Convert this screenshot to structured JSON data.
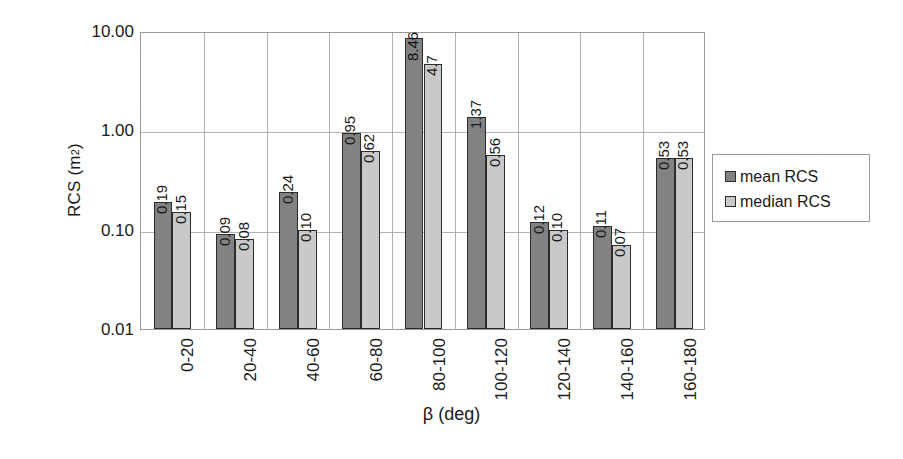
{
  "chart_data": {
    "type": "bar",
    "title": "",
    "xlabel": "β (deg)",
    "ylabel": "RCS (m²)",
    "yscale": "log",
    "ylim": [
      0.01,
      10.0
    ],
    "ytick_labels": [
      "10.00",
      "1.00",
      "0.10",
      "0.01"
    ],
    "ytick_values": [
      10.0,
      1.0,
      0.1,
      0.01
    ],
    "grid": "horizontal-and-vertical",
    "legend_position": "right",
    "categories": [
      "0-20",
      "20-40",
      "40-60",
      "60-80",
      "80-100",
      "100-120",
      "120-140",
      "140-160",
      "160-180"
    ],
    "series": [
      {
        "name": "mean RCS",
        "color": "#828282",
        "values": [
          0.19,
          0.09,
          0.24,
          0.95,
          8.46,
          1.37,
          0.12,
          0.11,
          0.53
        ],
        "labels": [
          "0.19",
          "0.09",
          "0.24",
          "0.95",
          "8.46",
          "1.37",
          "0.12",
          "0.11",
          "0.53"
        ]
      },
      {
        "name": "median RCS",
        "color": "#c9c9c9",
        "values": [
          0.15,
          0.08,
          0.1,
          0.62,
          4.7,
          0.56,
          0.1,
          0.07,
          0.53
        ],
        "labels": [
          "0.15",
          "0.08",
          "0.10",
          "0.62",
          "4.7",
          "0.56",
          "0.10",
          "0.07",
          "0.53"
        ]
      }
    ]
  },
  "axis": {
    "y_title_main": "RCS (m",
    "y_title_sup": "2",
    "y_title_close": ")",
    "x_title": "β (deg)"
  },
  "legend": {
    "items": [
      {
        "label": "mean RCS",
        "swatch": "mean"
      },
      {
        "label": "median RCS",
        "swatch": "median"
      }
    ]
  },
  "colors": {
    "mean": "#828282",
    "median": "#c9c9c9",
    "grid": "#b3b3b3",
    "axis": "#9a9a9a",
    "text": "#1a1a1a"
  }
}
